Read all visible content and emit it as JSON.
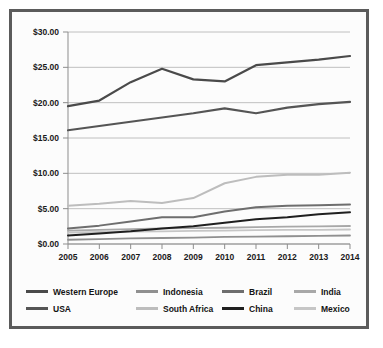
{
  "chart_data": {
    "type": "line",
    "title": "",
    "subtitle": "",
    "xlabel": "",
    "ylabel": "",
    "categories": [
      "2005",
      "2006",
      "2007",
      "2008",
      "2009",
      "2010",
      "2011",
      "2012",
      "2013",
      "2014"
    ],
    "x": [
      2005,
      2006,
      2007,
      2008,
      2009,
      2010,
      2011,
      2012,
      2013,
      2014
    ],
    "ylim": [
      0,
      30
    ],
    "ytick_values": [
      0,
      5,
      10,
      15,
      20,
      25,
      30
    ],
    "ytick_labels": [
      "$0.00",
      "$5.00",
      "$10.00",
      "$15.00",
      "$20.00",
      "$25.00",
      "$30.00"
    ],
    "xtick_labels": [
      "2005",
      "2006",
      "2007",
      "2008",
      "2009",
      "2010",
      "2011",
      "2012",
      "2013",
      "2014"
    ],
    "grid": true,
    "grid_axis": "y",
    "legend_position": "bottom",
    "value_prefix": "$",
    "series": [
      {
        "name": "Western Europe",
        "color": "#4a4a4a",
        "width": 2.2,
        "values": [
          19.5,
          20.3,
          22.9,
          24.8,
          23.3,
          23.0,
          25.3,
          25.7,
          26.1,
          26.6
        ]
      },
      {
        "name": "USA",
        "color": "#555555",
        "width": 2.2,
        "values": [
          16.1,
          16.7,
          17.3,
          17.9,
          18.5,
          19.2,
          18.5,
          19.3,
          19.8,
          20.1
        ]
      },
      {
        "name": "South Africa",
        "color": "#bdbdbd",
        "width": 2.0,
        "values": [
          5.4,
          5.7,
          6.1,
          5.8,
          6.5,
          8.6,
          9.5,
          9.8,
          9.8,
          10.1
        ]
      },
      {
        "name": "Brazil",
        "color": "#6e6e6e",
        "width": 2.0,
        "values": [
          2.2,
          2.6,
          3.2,
          3.8,
          3.8,
          4.6,
          5.2,
          5.4,
          5.5,
          5.6
        ]
      },
      {
        "name": "China",
        "color": "#1f1f1f",
        "width": 2.0,
        "values": [
          1.2,
          1.5,
          1.8,
          2.2,
          2.5,
          3.0,
          3.5,
          3.8,
          4.2,
          4.5
        ]
      },
      {
        "name": "India",
        "color": "#a8a8a8",
        "width": 1.8,
        "values": [
          1.9,
          2.0,
          2.1,
          2.2,
          2.25,
          2.3,
          2.4,
          2.45,
          2.5,
          2.55
        ]
      },
      {
        "name": "Mexico",
        "color": "#c6c6c6",
        "width": 1.8,
        "values": [
          1.6,
          1.7,
          1.75,
          1.8,
          1.85,
          1.9,
          1.95,
          2.0,
          2.0,
          2.05
        ]
      },
      {
        "name": "Indonesia",
        "color": "#909090",
        "width": 1.8,
        "values": [
          0.6,
          0.7,
          0.8,
          0.85,
          0.9,
          1.0,
          1.05,
          1.1,
          1.15,
          1.2
        ]
      }
    ]
  },
  "legend": {
    "rows": [
      [
        {
          "label": "Western Europe",
          "color": "#4a4a4a"
        },
        {
          "label": "Indonesia",
          "color": "#909090"
        },
        {
          "label": "Brazil",
          "color": "#6e6e6e"
        },
        {
          "label": "India",
          "color": "#a8a8a8"
        }
      ],
      [
        {
          "label": "USA",
          "color": "#555555"
        },
        {
          "label": "South Africa",
          "color": "#bdbdbd"
        },
        {
          "label": "China",
          "color": "#1f1f1f"
        },
        {
          "label": "Mexico",
          "color": "#c6c6c6"
        }
      ]
    ]
  },
  "style": {
    "frame_color": "#5b5b5b",
    "background": "#ffffff",
    "plot_background": "#fcfcfc",
    "grid_color": "#b9b9b9",
    "axis_color": "#8d8d8d",
    "text_color": "#1a1a1a"
  }
}
